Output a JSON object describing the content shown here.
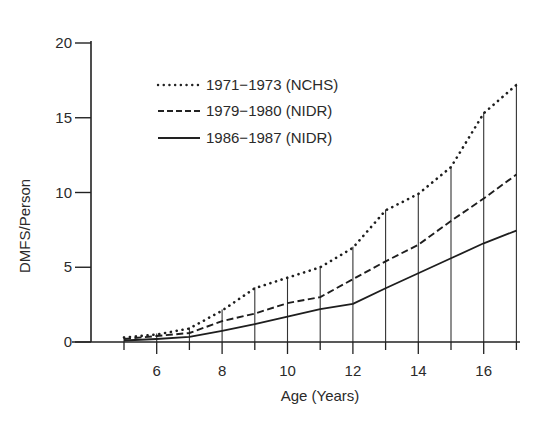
{
  "chart_data": {
    "type": "line",
    "title": "",
    "xlabel": "Age (Years)",
    "ylabel": "DMFS/Person",
    "xlim": [
      5,
      17
    ],
    "ylim": [
      0,
      20
    ],
    "x_ticks": [
      6,
      8,
      10,
      12,
      14,
      16
    ],
    "x_minor_ticks": [
      5,
      6,
      7,
      8,
      9,
      10,
      11,
      12,
      13,
      14,
      15,
      16,
      17
    ],
    "y_ticks": [
      0,
      5,
      10,
      15,
      20
    ],
    "grid": false,
    "drop_lines": true,
    "legend_position": "upper-left-inside",
    "x": [
      5,
      6,
      7,
      8,
      9,
      10,
      11,
      12,
      13,
      14,
      15,
      16,
      17
    ],
    "series": [
      {
        "name": "1971−1973 (NCHS)",
        "style": "dotted",
        "values": [
          0.3,
          0.5,
          0.9,
          2.1,
          3.6,
          4.3,
          5.0,
          6.3,
          8.8,
          9.9,
          11.7,
          15.3,
          17.2
        ]
      },
      {
        "name": "1979−1980 (NIDR)",
        "style": "dashed",
        "values": [
          0.2,
          0.4,
          0.6,
          1.4,
          1.9,
          2.6,
          3.0,
          4.2,
          5.4,
          6.5,
          8.1,
          9.6,
          11.2
        ]
      },
      {
        "name": "1986−1987 (NIDR)",
        "style": "solid",
        "values": [
          0.1,
          0.2,
          0.35,
          0.75,
          1.2,
          1.7,
          2.2,
          2.55,
          3.6,
          4.6,
          5.6,
          6.6,
          7.45
        ]
      }
    ]
  }
}
